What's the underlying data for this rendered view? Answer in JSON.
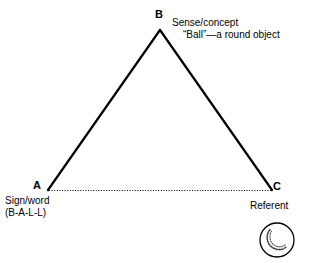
{
  "figure": {
    "background_color": "#ffffff",
    "line_color": "#000000"
  },
  "vertices": {
    "b": {
      "label": "B",
      "x": 160,
      "y": 30
    },
    "a": {
      "label": "A",
      "x": 48,
      "y": 190
    },
    "c": {
      "label": "C",
      "x": 272,
      "y": 190
    }
  },
  "annotations": {
    "sense": {
      "line1": "Sense/concept",
      "line2": "“Ball”—a round object"
    },
    "sign": {
      "line1": "Sign/word",
      "line2": "(B-A-L-L)"
    },
    "referent": {
      "line1": "Referent"
    }
  },
  "icons": {
    "ball": "ball-icon"
  },
  "edges": {
    "ab": {
      "style": "solid",
      "from": "A",
      "to": "B"
    },
    "bc": {
      "style": "solid",
      "from": "B",
      "to": "C"
    },
    "ac": {
      "style": "dotted",
      "from": "A",
      "to": "C"
    }
  }
}
